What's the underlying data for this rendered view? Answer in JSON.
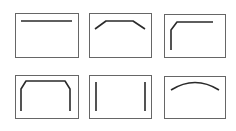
{
  "diagram": {
    "colors": {
      "background": "#ffffff",
      "panel_border": "#666666",
      "stroke": "#2a2a2a"
    },
    "panels": [
      {
        "name": "panel-straight-top-line",
        "box": [
          15,
          13,
          63,
          44
        ],
        "shape": "M 21 21 L 72 21"
      },
      {
        "name": "panel-chamfered-top-line",
        "box": [
          89,
          13,
          62,
          44
        ],
        "shape": "M 95 29 L 106 21 L 133 21 L 145 29"
      },
      {
        "name": "panel-top-left-corner",
        "box": [
          164,
          14,
          61,
          43
        ],
        "shape": "M 171 50 L 171 30 L 177 22 L 213 22"
      },
      {
        "name": "panel-chamfered-arch",
        "box": [
          15,
          75,
          63,
          43
        ],
        "shape": "M 21 111 L 21 89 L 26 81 L 65 81 L 70 89 L 70 111"
      },
      {
        "name": "panel-parallel-verticals",
        "box": [
          89,
          75,
          62,
          43
        ],
        "shape": "M 96 82 L 96 111 M 145 82 L 145 111"
      },
      {
        "name": "panel-arc",
        "box": [
          164,
          76,
          61,
          42
        ],
        "shape": "M 171 90 Q 195 75 219 90"
      }
    ]
  }
}
